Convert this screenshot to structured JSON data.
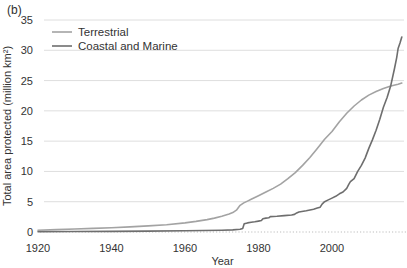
{
  "figure_label": "(b)",
  "colors": {
    "terrestrial_line": "#a3a3a3",
    "coastal_marine_line": "#6e6e6e",
    "gridline": "#dedede",
    "zero_line": "#bdbdbd",
    "text": "#333333",
    "background": "#ffffff"
  },
  "chart_data": {
    "type": "line",
    "title": "",
    "xlabel": "Year",
    "ylabel": "Total area protected (million km²)",
    "xlim": [
      1920,
      2020
    ],
    "ylim": [
      0,
      35
    ],
    "x_ticks": [
      1920,
      1940,
      1960,
      1980,
      2000
    ],
    "y_ticks": [
      0,
      5,
      10,
      15,
      20,
      25,
      30,
      35
    ],
    "grid": "horizontal, zero line dotted",
    "legend_position": "top-left inside plot",
    "series": [
      {
        "name": "Terrestrial",
        "color": "#a3a3a3",
        "points": [
          [
            1920,
            0.3
          ],
          [
            1925,
            0.4
          ],
          [
            1930,
            0.5
          ],
          [
            1935,
            0.6
          ],
          [
            1940,
            0.7
          ],
          [
            1945,
            0.85
          ],
          [
            1950,
            1.0
          ],
          [
            1955,
            1.2
          ],
          [
            1960,
            1.5
          ],
          [
            1963,
            1.75
          ],
          [
            1966,
            2.05
          ],
          [
            1968,
            2.3
          ],
          [
            1970,
            2.6
          ],
          [
            1972,
            2.95
          ],
          [
            1973,
            3.2
          ],
          [
            1974,
            3.6
          ],
          [
            1975,
            4.4
          ],
          [
            1976,
            4.8
          ],
          [
            1977,
            5.1
          ],
          [
            1978,
            5.4
          ],
          [
            1980,
            6.0
          ],
          [
            1982,
            6.6
          ],
          [
            1984,
            7.2
          ],
          [
            1986,
            7.9
          ],
          [
            1988,
            8.8
          ],
          [
            1990,
            9.8
          ],
          [
            1992,
            11.0
          ],
          [
            1994,
            12.3
          ],
          [
            1996,
            13.8
          ],
          [
            1998,
            15.3
          ],
          [
            2000,
            16.6
          ],
          [
            2002,
            18.2
          ],
          [
            2004,
            19.6
          ],
          [
            2006,
            20.8
          ],
          [
            2008,
            21.8
          ],
          [
            2010,
            22.6
          ],
          [
            2012,
            23.2
          ],
          [
            2014,
            23.7
          ],
          [
            2016,
            24.1
          ],
          [
            2018,
            24.4
          ],
          [
            2019,
            24.6
          ]
        ]
      },
      {
        "name": "Coastal and Marine",
        "color": "#6e6e6e",
        "points": [
          [
            1920,
            0.05
          ],
          [
            1930,
            0.08
          ],
          [
            1940,
            0.1
          ],
          [
            1950,
            0.15
          ],
          [
            1960,
            0.2
          ],
          [
            1965,
            0.25
          ],
          [
            1970,
            0.3
          ],
          [
            1973,
            0.35
          ],
          [
            1975,
            0.45
          ],
          [
            1975.7,
            0.6
          ],
          [
            1976.1,
            1.35
          ],
          [
            1977,
            1.5
          ],
          [
            1978,
            1.6
          ],
          [
            1979,
            1.68
          ],
          [
            1980,
            1.8
          ],
          [
            1980.8,
            1.9
          ],
          [
            1981.2,
            2.2
          ],
          [
            1982,
            2.3
          ],
          [
            1982.8,
            2.35
          ],
          [
            1983.2,
            2.55
          ],
          [
            1985,
            2.6
          ],
          [
            1987,
            2.7
          ],
          [
            1989,
            2.8
          ],
          [
            1989.8,
            2.9
          ],
          [
            1990.4,
            3.15
          ],
          [
            1991,
            3.3
          ],
          [
            1993,
            3.5
          ],
          [
            1995,
            3.75
          ],
          [
            1996,
            3.95
          ],
          [
            1996.8,
            4.1
          ],
          [
            1997.3,
            4.6
          ],
          [
            1998,
            5.0
          ],
          [
            1999,
            5.3
          ],
          [
            2000,
            5.6
          ],
          [
            2001,
            5.9
          ],
          [
            2002,
            6.3
          ],
          [
            2003,
            6.6
          ],
          [
            2004,
            7.2
          ],
          [
            2004.6,
            7.9
          ],
          [
            2005,
            8.3
          ],
          [
            2006,
            8.8
          ],
          [
            2007,
            10.0
          ],
          [
            2008,
            11.0
          ],
          [
            2009,
            12.2
          ],
          [
            2010,
            13.8
          ],
          [
            2011,
            15.2
          ],
          [
            2012,
            16.8
          ],
          [
            2013,
            18.6
          ],
          [
            2014,
            20.6
          ],
          [
            2015,
            22.2
          ],
          [
            2016,
            24.2
          ],
          [
            2017,
            27.0
          ],
          [
            2017.6,
            28.8
          ],
          [
            2018,
            30.3
          ],
          [
            2018.5,
            31.2
          ],
          [
            2019,
            32.2
          ]
        ]
      }
    ]
  }
}
